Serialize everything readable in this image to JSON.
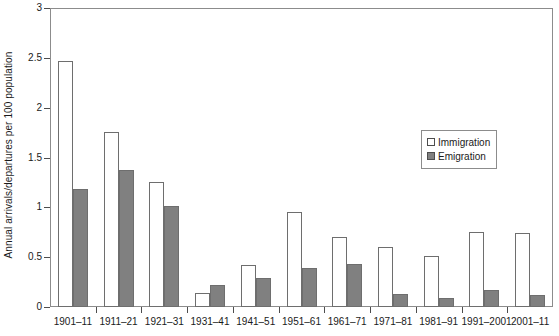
{
  "chart_data": {
    "type": "bar",
    "title": "",
    "subtitle": "",
    "xlabel": "",
    "ylabel": "Annual arrivals/departures per 100 population",
    "ylim": [
      0,
      3
    ],
    "ytick_labels": [
      "0",
      "0.5",
      "1",
      "1.5",
      "2",
      "2.5",
      "3"
    ],
    "ytick_values": [
      0,
      0.5,
      1,
      1.5,
      2,
      2.5,
      3
    ],
    "grid": false,
    "legend_position": "right-center",
    "categories": [
      "1901–11",
      "1911–21",
      "1921–31",
      "1931–41",
      "1941–51",
      "1951–61",
      "1961–71",
      "1971–81",
      "1981–91",
      "1991–2001",
      "2001–11"
    ],
    "series": [
      {
        "name": "Immigration",
        "color": "#ffffff",
        "values": [
          2.47,
          1.76,
          1.25,
          0.14,
          0.42,
          0.95,
          0.7,
          0.6,
          0.51,
          0.75,
          0.74
        ]
      },
      {
        "name": "Emigration",
        "color": "#808080",
        "values": [
          1.18,
          1.37,
          1.01,
          0.22,
          0.29,
          0.39,
          0.43,
          0.13,
          0.09,
          0.17,
          0.12
        ]
      }
    ]
  },
  "legend": {
    "items": [
      {
        "label": "Immigration",
        "swatch": "open-square-swatch"
      },
      {
        "label": "Emigration",
        "swatch": "filled-square-swatch"
      }
    ]
  },
  "axes": {
    "y_title": "Annual arrivals/departures per 100 population"
  },
  "colors": {
    "emigration_fill": "#808080",
    "immigration_fill": "#ffffff",
    "axis_line": "#8c8c8c",
    "bar_outline": "#6e6e6e",
    "text": "#1a1a1a"
  }
}
